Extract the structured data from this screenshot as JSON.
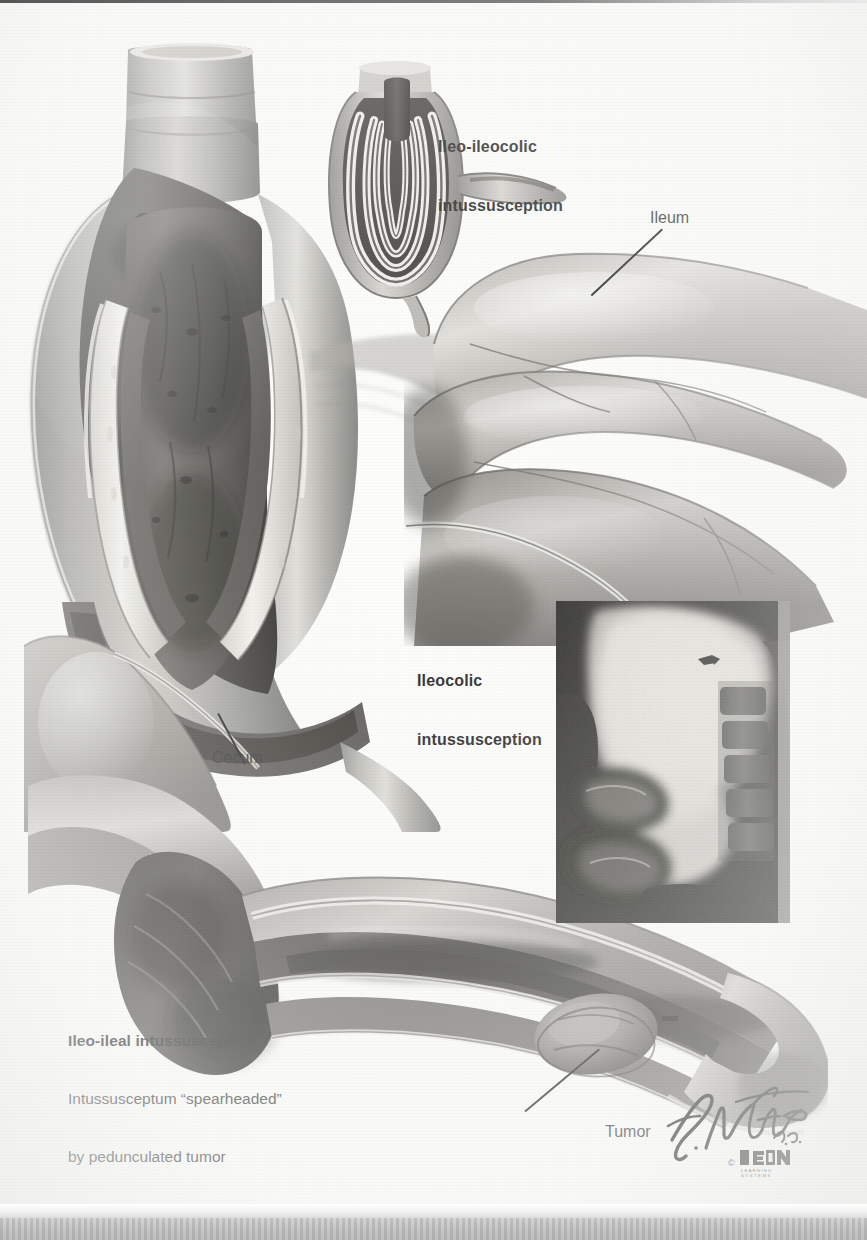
{
  "plate": {
    "title_alt": "Intussusception",
    "artist_signature": "F. Netter",
    "artist_credential": "M.D.",
    "publisher_mark": "ICON",
    "publisher_sub": "LEARNING SYSTEMS",
    "copyright_symbol": "©"
  },
  "labels": {
    "ileo_ileocolic_line1": "Ileo-ileocolic",
    "ileo_ileocolic_line2": "intussusception",
    "ileum": "Ileum",
    "ileocolic_line1": "Ileocolic",
    "ileocolic_line2": "intussusception",
    "cecum": "Cecum",
    "tumor": "Tumor",
    "ileo_ileal_title": "Ileo-ileal intussusception",
    "ileo_ileal_body_line1": "Intussusceptum “spearheaded”",
    "ileo_ileal_body_line2": "by pedunculated tumor"
  },
  "figures": {
    "main_cutaway": "ileocolic-intussusception-cutaway",
    "inset_diagram": "ileo-ileocolic-schematic",
    "ileum_loops": "ileum-loops",
    "bottom_cutaway": "ileo-ileal-cutaway",
    "radiograph": "barium-enema-radiograph"
  },
  "colors": {
    "ink": "#1c1c1c",
    "paper": "#fdfdfc",
    "tissue_mid": "#8f8f8f",
    "tissue_dark": "#3f3f3f",
    "tissue_light": "#d8d6d2",
    "mucosa_highlight": "#efeeea",
    "radiograph_dark": "#141414",
    "radiograph_light": "#dcdad5",
    "scan_band": "#c6c6c6"
  }
}
